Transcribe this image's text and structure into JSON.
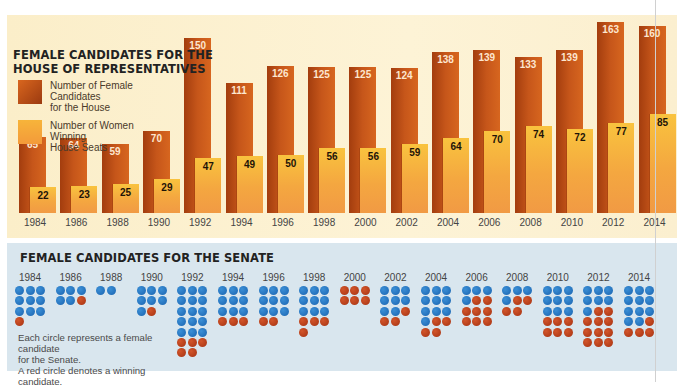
{
  "chart_data": [
    {
      "type": "bar",
      "title": "FEMALE CANDIDATES FOR THE HOUSE OF REPRESENTATIVES",
      "categories": [
        "1984",
        "1986",
        "1988",
        "1990",
        "1992",
        "1994",
        "1996",
        "1998",
        "2000",
        "2002",
        "2004",
        "2006",
        "2008",
        "2010",
        "2012",
        "2014"
      ],
      "series": [
        {
          "name": "Number of Female Candidates for the House",
          "color": "#c4551a",
          "values": [
            65,
            64,
            59,
            70,
            150,
            111,
            126,
            125,
            125,
            124,
            138,
            139,
            133,
            139,
            163,
            160
          ]
        },
        {
          "name": "Number of Women Winning House Seats",
          "color": "#f5a93c",
          "values": [
            22,
            23,
            25,
            29,
            47,
            49,
            50,
            56,
            56,
            59,
            64,
            70,
            74,
            72,
            77,
            85
          ]
        }
      ],
      "xlabel": "",
      "ylabel": "",
      "ylim": [
        0,
        165
      ],
      "grid": false,
      "legend_position": "upper-left"
    },
    {
      "type": "table",
      "title": "FEMALE CANDIDATES FOR THE SENATE",
      "categories": [
        "1984",
        "1986",
        "1988",
        "1990",
        "1992",
        "1994",
        "1996",
        "1998",
        "2000",
        "2002",
        "2004",
        "2006",
        "2008",
        "2010",
        "2012",
        "2014"
      ],
      "series": [
        {
          "name": "Female candidates (total circles)",
          "values": [
            10,
            6,
            2,
            8,
            20,
            12,
            11,
            13,
            6,
            11,
            14,
            12,
            8,
            15,
            18,
            15
          ]
        },
        {
          "name": "Winning candidates (red circles)",
          "values": [
            1,
            1,
            0,
            1,
            5,
            3,
            2,
            4,
            6,
            3,
            4,
            8,
            4,
            6,
            11,
            4
          ]
        }
      ],
      "note": "Each circle represents a female candidate for the Senate. A red circle denotes a winning candidate."
    }
  ],
  "house": {
    "title_line1": "FEMALE CANDIDATES FOR THE",
    "title_line2": "HOUSE OF REPRESENTATIVES",
    "legend": [
      {
        "label_line1": "Number of Female Candidates",
        "label_line2": "for the House"
      },
      {
        "label_line1": "Number of Women Winning",
        "label_line2": "House Seats"
      }
    ]
  },
  "senate": {
    "title": "FEMALE CANDIDATES FOR THE SENATE",
    "note_line1": "Each circle represents a female candidate",
    "note_line2": "for the Senate.",
    "note_line3": "A red circle denotes a winning candidate.",
    "dots": {
      "1984": "bbbbbbbbbr",
      "1986": "bbbbbr",
      "1988": "bb",
      "1990": "bbbbbbbr",
      "1992": "bbbbbbbbbbbbbbbrrrrr",
      "1994": "bbbbbbbbbrrr",
      "1996": "bbbbbbbbbrr",
      "1998": "bbbbbbbbbrrrr",
      "2000": "rrrrrr",
      "2002": "bbbbbbbbrrr",
      "2004": "bbbbbbbbbbrrrr",
      "2006": "bbbbrrrrrrrr",
      "2008": "bbbbrrrr",
      "2010": "bbbbbbbbbrrrrrr",
      "2012": "bbbbbbbrrrrrrrrrrr",
      "2014": "bbbbbbbbbbbrrrr"
    }
  },
  "colors": {
    "house_bg": "#fcf0d0",
    "candidates_bar": "#c4551a",
    "winners_bar": "#f5a93c",
    "senate_bg": "#d9e6ee",
    "blue_dot": "#2274c2",
    "red_dot": "#bb431c"
  }
}
